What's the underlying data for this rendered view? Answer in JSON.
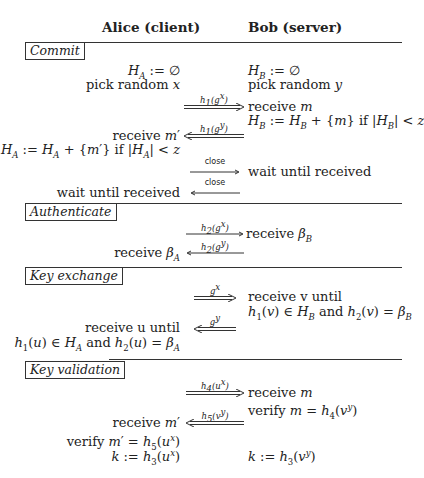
{
  "header": {
    "alice": "Alice (client)",
    "bob": "Bob (server)"
  },
  "sections": {
    "commit": "Commit",
    "authenticate": "Authenticate",
    "key_exchange": "Key exchange",
    "key_validation": "Key validation"
  },
  "commit": {
    "alice_init": "H_A := ∅",
    "alice_pick": "pick random x",
    "bob_init": "H_B := ∅",
    "bob_pick": "pick random y",
    "msg1_label": "h1(g^x)",
    "bob_receive": "receive m",
    "bob_update": "H_B := H_B + {m} if |H_B| < z",
    "msg2_label": "h1(g^y)",
    "alice_receive": "receive m′",
    "alice_update": "H_A := H_A + {m′} if |H_A| < z",
    "close1_label": "close",
    "bob_wait": "wait until received",
    "close2_label": "close",
    "alice_wait": "wait until received"
  },
  "authenticate": {
    "msg1_label": "h2(g^x)",
    "bob_receive": "receive β_B",
    "msg2_label": "h2(g^y)",
    "alice_receive": "receive β_A"
  },
  "key_exchange": {
    "msg1_label": "g^x",
    "bob_receive_1": "receive v until",
    "bob_receive_2": "h1(v) ∈ H_B and h2(v) = β_B",
    "msg2_label": "g^y",
    "alice_receive_1": "receive u until",
    "alice_receive_2": "h1(u) ∈ H_A and h2(u) = β_A"
  },
  "key_validation": {
    "msg1_label": "h4(u^x)",
    "bob_receive": "receive m",
    "bob_verify": "verify m = h4(v^y)",
    "msg2_label": "h5(v^y)",
    "alice_receive": "receive m′",
    "alice_verify": "verify m′ = h5(u^x)",
    "alice_key": "k := h3(u^x)",
    "bob_key": "k := h3(v^y)"
  }
}
